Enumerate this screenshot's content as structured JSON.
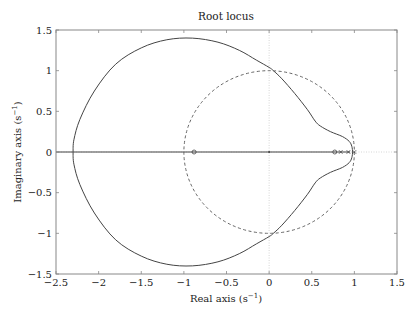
{
  "chart_data": {
    "type": "line",
    "title": "Root locus",
    "xlabel": "Real axis (s",
    "xlabel_sup": "−1",
    "xlabel_end": ")",
    "ylabel": "Imaginary axis (s",
    "ylabel_sup": "−1",
    "ylabel_end": ")",
    "xlim": [
      -2.5,
      1.5
    ],
    "ylim": [
      -1.5,
      1.5
    ],
    "xticks": [
      -2.5,
      -2,
      -1.5,
      -1,
      -0.5,
      0,
      0.5,
      1,
      1.5
    ],
    "xtick_labels": [
      "−2.5",
      "−2",
      "−1.5",
      "−1",
      "−0.5",
      "0",
      "0.5",
      "1",
      "1.5"
    ],
    "yticks": [
      1.5,
      1,
      0.5,
      0,
      -0.5,
      -1,
      -1.5
    ],
    "ytick_labels": [
      "1.5",
      "1",
      "0.5",
      "0",
      "−0.5",
      "−1",
      "−1.5"
    ],
    "grid": false,
    "series": [
      {
        "name": "root-locus-branch-upper",
        "style": "solid",
        "points": [
          [
            0.98,
            0.0
          ],
          [
            0.97,
            0.07
          ],
          [
            0.94,
            0.13
          ],
          [
            0.86,
            0.19
          ],
          [
            0.72,
            0.25
          ],
          [
            0.6,
            0.32
          ],
          [
            0.54,
            0.38
          ],
          [
            0.45,
            0.52
          ],
          [
            0.3,
            0.72
          ],
          [
            0.15,
            0.9
          ],
          [
            0.05,
            1.0
          ],
          [
            0.0,
            1.04
          ],
          [
            -0.15,
            1.13
          ],
          [
            -0.35,
            1.25
          ],
          [
            -0.6,
            1.35
          ],
          [
            -0.9,
            1.4
          ],
          [
            -1.2,
            1.38
          ],
          [
            -1.5,
            1.28
          ],
          [
            -1.8,
            1.08
          ],
          [
            -2.05,
            0.75
          ],
          [
            -2.22,
            0.4
          ],
          [
            -2.29,
            0.15
          ],
          [
            -2.3,
            0.0
          ]
        ]
      },
      {
        "name": "root-locus-branch-lower",
        "style": "solid",
        "points": [
          [
            0.98,
            0.0
          ],
          [
            0.97,
            -0.07
          ],
          [
            0.94,
            -0.13
          ],
          [
            0.86,
            -0.19
          ],
          [
            0.72,
            -0.25
          ],
          [
            0.6,
            -0.32
          ],
          [
            0.54,
            -0.38
          ],
          [
            0.45,
            -0.52
          ],
          [
            0.3,
            -0.72
          ],
          [
            0.15,
            -0.9
          ],
          [
            0.05,
            -1.0
          ],
          [
            0.0,
            -1.04
          ],
          [
            -0.15,
            -1.13
          ],
          [
            -0.35,
            -1.25
          ],
          [
            -0.6,
            -1.35
          ],
          [
            -0.9,
            -1.4
          ],
          [
            -1.2,
            -1.38
          ],
          [
            -1.5,
            -1.28
          ],
          [
            -1.8,
            -1.08
          ],
          [
            -2.05,
            -0.75
          ],
          [
            -2.22,
            -0.4
          ],
          [
            -2.29,
            -0.15
          ],
          [
            -2.3,
            0.0
          ]
        ]
      },
      {
        "name": "real-axis-locus",
        "style": "solid",
        "points": [
          [
            -2.5,
            0.0
          ],
          [
            0.95,
            0.0
          ]
        ]
      },
      {
        "name": "unit-circle",
        "style": "dashed",
        "shape": "circle",
        "center": [
          0,
          0
        ],
        "radius": 1
      }
    ],
    "markers": [
      {
        "type": "zero",
        "x": -0.88,
        "y": 0
      },
      {
        "type": "dot",
        "x": 0,
        "y": 0
      },
      {
        "type": "zero",
        "x": 0.77,
        "y": 0
      },
      {
        "type": "pole",
        "x": 0.84,
        "y": 0
      },
      {
        "type": "pole",
        "x": 0.93,
        "y": 0
      },
      {
        "type": "pole",
        "x": 1.0,
        "y": 0
      }
    ],
    "reference_lines": [
      {
        "orientation": "vertical",
        "value": 0,
        "style": "dotted"
      },
      {
        "orientation": "horizontal",
        "value": 0,
        "style": "dotted"
      }
    ]
  },
  "colors": {
    "line": "#444444",
    "dashed": "#666666",
    "frame": "#888888",
    "reference": "#cccccc"
  }
}
